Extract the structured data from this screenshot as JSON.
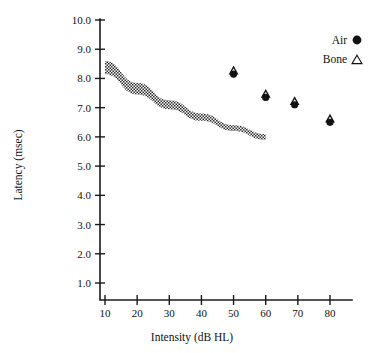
{
  "chart_data": {
    "type": "scatter",
    "title": "",
    "xlabel": "Intensity (dB HL)",
    "ylabel": "Latency (msec)",
    "xlim": [
      0,
      85
    ],
    "ylim": [
      0,
      10.0
    ],
    "grid": false,
    "x_ticks": [
      10,
      20,
      30,
      40,
      50,
      60,
      70,
      80
    ],
    "x_tick_labels": [
      "10",
      "20",
      "30",
      "40",
      "50",
      "60",
      "70",
      "80"
    ],
    "y_ticks": [
      1.0,
      2.0,
      3.0,
      4.0,
      5.0,
      6.0,
      7.0,
      8.0,
      9.0,
      10.0
    ],
    "y_tick_labels": [
      "1.0",
      "2.0",
      "3.0",
      "4.0",
      "5.0",
      "6.0",
      "7.0",
      "8.0",
      "9.0",
      "10.0"
    ],
    "legend_position": "top-right",
    "legend": [
      {
        "name": "Air",
        "marker": "filled-circle"
      },
      {
        "name": "Bone",
        "marker": "open-triangle"
      }
    ],
    "series": [
      {
        "name": "Air",
        "marker": "filled-circle",
        "x": [
          50,
          60,
          69,
          80
        ],
        "y": [
          8.15,
          7.35,
          7.1,
          6.5
        ]
      },
      {
        "name": "Bone",
        "marker": "open-triangle",
        "x": [
          50,
          60,
          69,
          80
        ],
        "y": [
          8.25,
          7.45,
          7.2,
          6.6
        ]
      }
    ],
    "band": {
      "name": "normative-range-band",
      "description": "hatched normative latency-intensity band",
      "x": [
        10,
        20,
        30,
        40,
        50,
        60
      ],
      "y_upper": [
        8.6,
        7.85,
        7.25,
        6.8,
        6.4,
        6.1
      ],
      "y_lower": [
        8.15,
        7.45,
        6.95,
        6.55,
        6.2,
        5.9
      ]
    },
    "annotations": []
  },
  "legend": {
    "air_label": "Air",
    "bone_label": "Bone"
  },
  "axes": {
    "x_title": "Intensity (dB HL)",
    "y_title": "Latency (msec)"
  }
}
